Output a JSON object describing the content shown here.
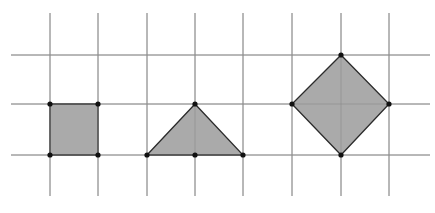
{
  "diagram": {
    "width": 435,
    "height": 213,
    "colors": {
      "background": "#ffffff",
      "grid_line": "#8c8c8c",
      "shape_fill": "#a3a3a3",
      "shape_stroke": "#2b2b2b",
      "vertex": "#111111"
    },
    "grid": {
      "horizontal_lines_y": [
        55,
        104,
        155
      ],
      "horizontal_extent_x": [
        11,
        430
      ],
      "vertical_lines_x": [
        50,
        98,
        147,
        195,
        243,
        292,
        341,
        389
      ],
      "vertical_extent_y": [
        13,
        196
      ]
    },
    "shapes": [
      {
        "name": "square",
        "points": [
          [
            50,
            104
          ],
          [
            98,
            104
          ],
          [
            98,
            155
          ],
          [
            50,
            155
          ]
        ],
        "vertices": [
          [
            50,
            104
          ],
          [
            98,
            104
          ],
          [
            98,
            155
          ],
          [
            50,
            155
          ]
        ]
      },
      {
        "name": "triangle",
        "points": [
          [
            147,
            155
          ],
          [
            195,
            104
          ],
          [
            243,
            155
          ]
        ],
        "vertices": [
          [
            147,
            155
          ],
          [
            195,
            104
          ],
          [
            243,
            155
          ],
          [
            195,
            155
          ]
        ]
      },
      {
        "name": "diamond",
        "points": [
          [
            341,
            55
          ],
          [
            389,
            104
          ],
          [
            341,
            155
          ],
          [
            292,
            104
          ]
        ],
        "vertices": [
          [
            341,
            55
          ],
          [
            389,
            104
          ],
          [
            341,
            155
          ],
          [
            292,
            104
          ]
        ]
      }
    ]
  }
}
